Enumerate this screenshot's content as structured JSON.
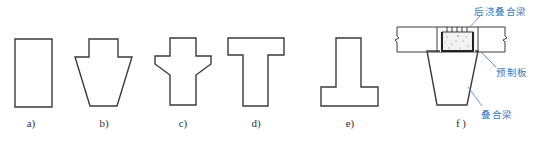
{
  "figure": {
    "panels": [
      {
        "id": "a",
        "label": "a)",
        "shape": "rectangle-section"
      },
      {
        "id": "b",
        "label": "b)",
        "shape": "trapezoid-with-top-stem-section"
      },
      {
        "id": "c",
        "label": "c)",
        "shape": "cross-with-haunched-wings-section"
      },
      {
        "id": "d",
        "label": "d)",
        "shape": "T-section"
      },
      {
        "id": "e",
        "label": "e)",
        "shape": "inverted-T-section"
      },
      {
        "id": "f",
        "label": "f )",
        "shape": "composite-beam-with-precast-slab"
      }
    ],
    "callouts": {
      "cast_in_place": "后浇叠合梁",
      "precast_slab": "预制板",
      "composite_beam": "叠合梁"
    },
    "colors": {
      "outline": "#3a3a3a",
      "callout_text": "#3a78c2",
      "concrete_fill": "#f2f2f2"
    }
  }
}
